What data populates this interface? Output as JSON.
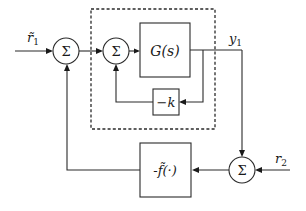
{
  "diagram": {
    "type": "block-diagram",
    "inputs": {
      "r1": "r̃",
      "r1_sub": "1",
      "r2": "r",
      "r2_sub": "2"
    },
    "outputs": {
      "y1": "y",
      "y1_sub": "1"
    },
    "summing_junctions": [
      {
        "id": "sum1",
        "symbol": "Σ"
      },
      {
        "id": "sum2",
        "symbol": "Σ"
      },
      {
        "id": "sum3",
        "symbol": "Σ"
      }
    ],
    "blocks": {
      "plant": "G(s)",
      "gain": "−k",
      "nonlinearity": "-f̃(·)"
    },
    "groups": [
      {
        "id": "inner-loop",
        "style": "dashed",
        "contains": [
          "sum2",
          "plant",
          "gain"
        ]
      }
    ],
    "connections": [
      {
        "from": "r1",
        "to": "sum1"
      },
      {
        "from": "sum1",
        "to": "sum2"
      },
      {
        "from": "sum2",
        "to": "plant"
      },
      {
        "from": "plant",
        "to": "y1"
      },
      {
        "from": "plant",
        "to": "gain"
      },
      {
        "from": "gain",
        "to": "sum2"
      },
      {
        "from": "y1",
        "to": "sum3"
      },
      {
        "from": "r2",
        "to": "sum3"
      },
      {
        "from": "sum3",
        "to": "nonlinearity"
      },
      {
        "from": "nonlinearity",
        "to": "sum1"
      }
    ]
  }
}
